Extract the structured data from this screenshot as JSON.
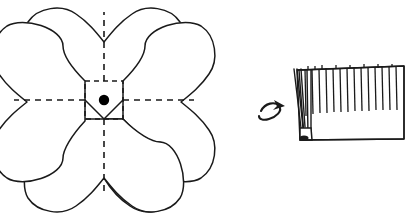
{
  "figure": {
    "title": "Flower petal template and folded fringe strip",
    "background_color": "#ffffff",
    "line_color": "#1a1a1a",
    "width": 411,
    "height": 213
  },
  "left_diagram": {
    "name": "five-petal-flower-template",
    "description": "Five heart-shaped petals arranged around a square center with dashed fold lines",
    "petal_count": 5,
    "petal_shape": "heart",
    "center": {
      "shape": "square",
      "dot_color": "#000000",
      "dot_label": "center-point",
      "cx": 104,
      "cy": 100,
      "dot_radius": 5,
      "square_half": 19
    },
    "fold_lines": {
      "style": "dashed",
      "color": "#1a1a1a",
      "count": 4,
      "directions": [
        "up",
        "down",
        "left",
        "right"
      ]
    },
    "bounds": {
      "x": 9,
      "y": 8,
      "width": 190,
      "height": 192
    }
  },
  "right_diagram": {
    "name": "folded-fringe-strip",
    "description": "Rectangular paper strip with fringe cuts along the top edge and accordion pleats gathered at the left",
    "fringe_count": 14,
    "pleat_count": 5,
    "bounds": {
      "x": 290,
      "y": 63,
      "width": 115,
      "height": 77
    },
    "arrow": {
      "name": "curved-roll-arrow",
      "direction": "right",
      "style": "curved",
      "cx": 272,
      "cy": 114
    }
  },
  "colors": {
    "stroke": "#1a1a1a",
    "fill": "#ffffff",
    "dot": "#000000"
  }
}
